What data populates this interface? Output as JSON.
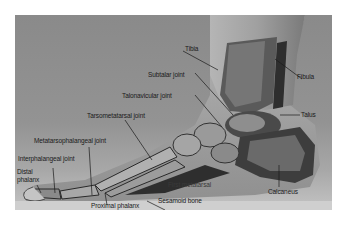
{
  "figure": {
    "labels": {
      "tibia": "Tibia",
      "fibula": "Fibula",
      "subtalar_joint": "Subtalar joint",
      "talonavicular_joint": "Talonavicular joint",
      "talus": "Talus",
      "tarsometatarsal_joint": "Tarsometatarsal joint",
      "metatarsophalangeal_joint": "Metatarsophalangeal joint",
      "interphalangeal_joint": "Interphalangeal joint",
      "distal_phalanx_line1": "Distal",
      "distal_phalanx_line2": "phalanx",
      "first_metatarsal": "First metatarsal",
      "calcaneus": "Calcaneus",
      "proximal_phalanx": "Proximal phalanx",
      "sesamoid_bone": "Sesamoid bone"
    },
    "colors": {
      "background": "#8f8f8f",
      "bone_light": "#c8c8c8",
      "bone_dark": "#3a3a3a",
      "label_text": "#1a1a1a"
    }
  }
}
